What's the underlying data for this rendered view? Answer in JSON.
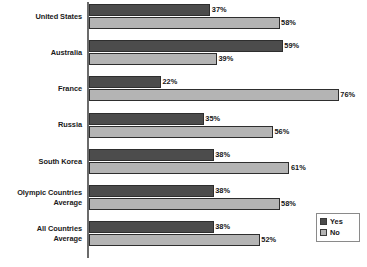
{
  "chart_data": {
    "type": "bar",
    "orientation": "horizontal",
    "title": "",
    "subtitle": "",
    "xlabel": "",
    "ylabel": "",
    "xlim": [
      0,
      80
    ],
    "grid": false,
    "legend_position": "bottom-right",
    "value_suffix": "%",
    "categories": [
      "United States",
      "Australia",
      "France",
      "Russia",
      "South Korea",
      "Olympic Countries Average",
      "All Countries Average"
    ],
    "category_lines": [
      [
        "United States"
      ],
      [
        "Australia"
      ],
      [
        "France"
      ],
      [
        "Russia"
      ],
      [
        "South Korea"
      ],
      [
        "Olympic Countries",
        "Average"
      ],
      [
        "All Countries",
        "Average"
      ]
    ],
    "series": [
      {
        "name": "Yes",
        "color": "#4c4c4c",
        "values": [
          37,
          59,
          22,
          35,
          38,
          38,
          38
        ],
        "labels": [
          "37%",
          "59%",
          "22%",
          "35%",
          "38%",
          "38%",
          "38%"
        ]
      },
      {
        "name": "No",
        "color": "#b4b4b4",
        "values": [
          58,
          39,
          76,
          56,
          61,
          58,
          52
        ],
        "labels": [
          "58%",
          "39%",
          "76%",
          "56%",
          "61%",
          "58%",
          "52%"
        ]
      }
    ]
  },
  "legend": {
    "items": [
      {
        "label": "Yes",
        "swatch": "yes"
      },
      {
        "label": "No",
        "swatch": "no"
      }
    ]
  },
  "colors": {
    "series_yes": "#4c4c4c",
    "series_no": "#b4b4b4",
    "axis": "#6b6b6b",
    "text": "#1a1a1a",
    "background": "#ffffff"
  }
}
